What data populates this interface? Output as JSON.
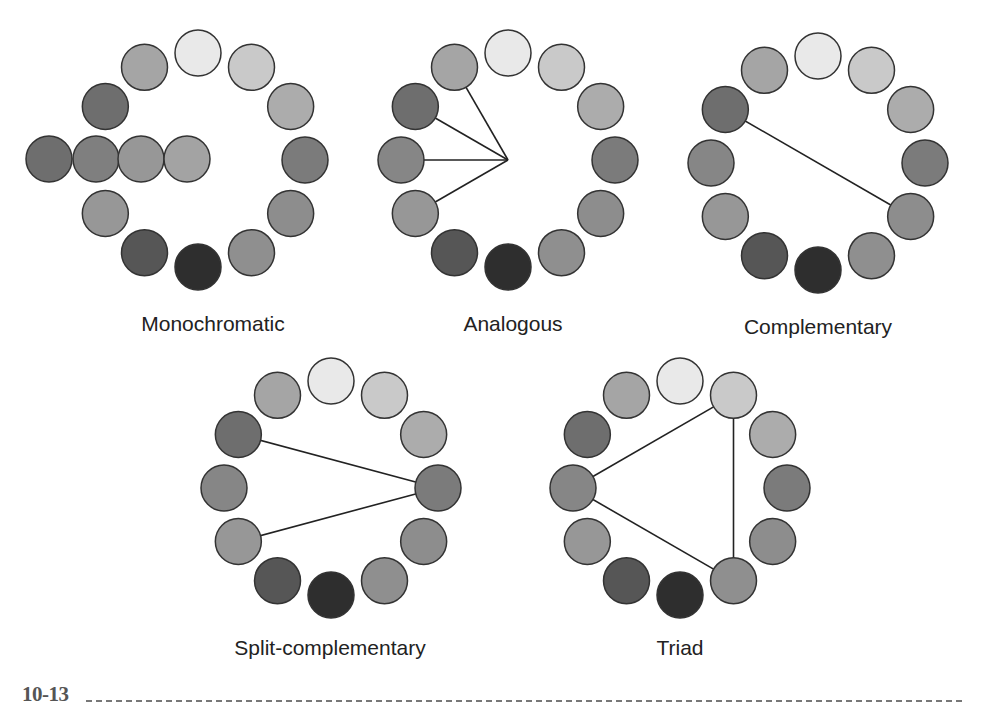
{
  "figure_number": "10-13",
  "shades": [
    "#e9e9e9",
    "#c9c9c9",
    "#acacac",
    "#7b7b7b",
    "#8d8d8d",
    "#8f8f8f",
    "#2e2e2e",
    "#565656",
    "#979797",
    "#868686",
    "#6e6e6e",
    "#a5a5a5"
  ],
  "circle_radius": 23,
  "ring_radius": 107,
  "wheels": [
    {
      "id": "monochromatic",
      "label": "Monochromatic",
      "cx": 198,
      "cy": 160,
      "skip": [
        9
      ],
      "extra": [
        {
          "x": 49,
          "y": 159,
          "fill": "#6e6e6e"
        },
        {
          "x": 96,
          "y": 159,
          "fill": "#7f7f7f"
        },
        {
          "x": 141,
          "y": 159,
          "fill": "#979797"
        },
        {
          "x": 187,
          "y": 159,
          "fill": "#a3a3a3"
        }
      ],
      "lines": [],
      "label_x": 213,
      "label_y": 312
    },
    {
      "id": "analogous",
      "label": "Analogous",
      "cx": 508,
      "cy": 160,
      "skip": [],
      "extra": [],
      "hub": {
        "x": 508,
        "y": 160
      },
      "spokes": [
        9,
        10,
        8,
        11
      ],
      "lines": [],
      "label_x": 513,
      "label_y": 312
    },
    {
      "id": "complementary",
      "label": "Complementary",
      "cx": 818,
      "cy": 163,
      "skip": [],
      "extra": [],
      "lines": [
        [
          10,
          4
        ]
      ],
      "label_x": 818,
      "label_y": 315
    },
    {
      "id": "split-complementary",
      "label": "Split-complementary",
      "cx": 331,
      "cy": 488,
      "skip": [],
      "extra": [],
      "lines": [
        [
          10,
          3
        ],
        [
          8,
          3
        ]
      ],
      "label_x": 330,
      "label_y": 636
    },
    {
      "id": "triad",
      "label": "Triad",
      "cx": 680,
      "cy": 488,
      "skip": [],
      "extra": [],
      "lines": [
        [
          1,
          9
        ],
        [
          9,
          5
        ],
        [
          5,
          1
        ]
      ],
      "label_x": 680,
      "label_y": 636
    }
  ]
}
